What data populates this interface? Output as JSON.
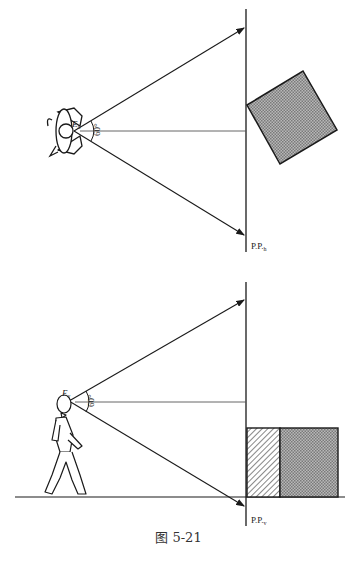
{
  "figure": {
    "caption": "图 5-21",
    "top_view": {
      "eye_label": "E",
      "eye_subscript": "h",
      "angle_label": "60°",
      "picture_plane_label": "P.P.",
      "picture_plane_subscript": "h",
      "object": "rotated square (plan view), shaded"
    },
    "side_view": {
      "eye_label": "E",
      "eye_subscript": "v",
      "angle_label": "60°",
      "picture_plane_label": "P.P.",
      "picture_plane_subscript": "v",
      "object": "rectangular block (elevation), left face hatched, right face shaded"
    }
  },
  "colors": {
    "line": "#1a1a1a",
    "shade": "#9a9a9a",
    "background": "#ffffff"
  }
}
